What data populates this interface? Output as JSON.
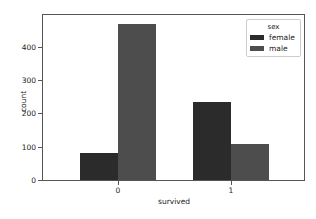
{
  "chart_data": {
    "type": "bar",
    "title": "",
    "xlabel": "survived",
    "ylabel": "count",
    "categories": [
      "0",
      "1"
    ],
    "series": [
      {
        "name": "female",
        "values": [
          81,
          233
        ],
        "color": "#2b2b2b"
      },
      {
        "name": "male",
        "values": [
          468,
          109
        ],
        "color": "#4d4d4d"
      }
    ],
    "yticks": [
      "0",
      "100",
      "200",
      "300",
      "400"
    ],
    "ylim": [
      0,
      495
    ],
    "grid": false,
    "legend": {
      "title": "sex",
      "position": "upper right",
      "entries": [
        "female",
        "male"
      ]
    }
  }
}
